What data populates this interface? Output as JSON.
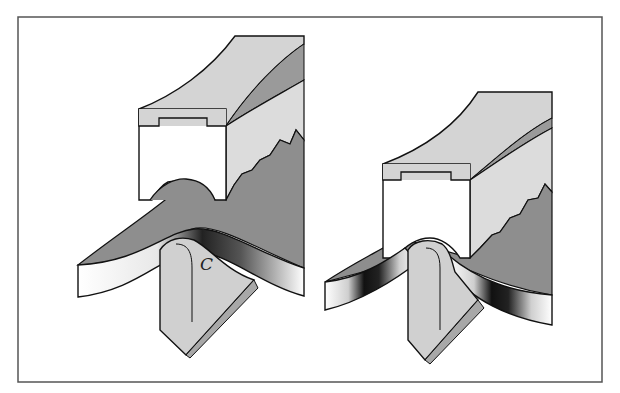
{
  "figure": {
    "panels": [
      {
        "id": "left",
        "state": "shallow-bend",
        "blade_label": "C"
      },
      {
        "id": "right",
        "state": "deep-bend",
        "blade_label": ""
      }
    ]
  },
  "colors": {
    "background": "#ffffff",
    "frame": "#555555",
    "block_face": "#ffffff",
    "block_top": "#d4d4d4",
    "block_side_light": "#dcdcdc",
    "block_side_dark": "#9a9a9a",
    "strip_top": "#8e8e8e",
    "blade_face": "#d0d0d0",
    "blade_bevel": "#a8a8a8",
    "outline": "#111111"
  }
}
